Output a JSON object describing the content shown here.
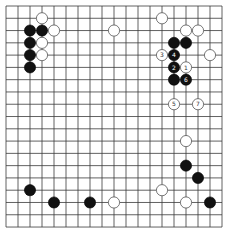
{
  "board": {
    "size": 19,
    "background": "#ffffff",
    "line_color": "#3a3a3a",
    "origin_x": 6,
    "origin_y": 6,
    "spacing_x": 12,
    "spacing_y": 12.28,
    "stone_radius": 5.6
  },
  "stones": [
    {
      "color": "white",
      "col": 3,
      "row": 1,
      "label": ""
    },
    {
      "color": "black",
      "col": 2,
      "row": 2,
      "label": ""
    },
    {
      "color": "black",
      "col": 3,
      "row": 2,
      "label": ""
    },
    {
      "color": "white",
      "col": 4,
      "row": 2,
      "label": ""
    },
    {
      "color": "black",
      "col": 2,
      "row": 3,
      "label": ""
    },
    {
      "color": "white",
      "col": 3,
      "row": 3,
      "label": ""
    },
    {
      "color": "black",
      "col": 2,
      "row": 4,
      "label": ""
    },
    {
      "color": "white",
      "col": 3,
      "row": 4,
      "label": ""
    },
    {
      "color": "black",
      "col": 2,
      "row": 5,
      "label": ""
    },
    {
      "color": "white",
      "col": 9,
      "row": 2,
      "label": ""
    },
    {
      "color": "white",
      "col": 13,
      "row": 1,
      "label": ""
    },
    {
      "color": "white",
      "col": 15,
      "row": 2,
      "label": ""
    },
    {
      "color": "white",
      "col": 16,
      "row": 2,
      "label": ""
    },
    {
      "color": "black",
      "col": 14,
      "row": 3,
      "label": ""
    },
    {
      "color": "black",
      "col": 15,
      "row": 3,
      "label": ""
    },
    {
      "color": "white",
      "col": 13,
      "row": 4,
      "label": "3"
    },
    {
      "color": "black",
      "col": 14,
      "row": 4,
      "label": "4"
    },
    {
      "color": "white",
      "col": 17,
      "row": 4,
      "label": ""
    },
    {
      "color": "black",
      "col": 14,
      "row": 5,
      "label": "2"
    },
    {
      "color": "white",
      "col": 15,
      "row": 5,
      "label": "1"
    },
    {
      "color": "black",
      "col": 14,
      "row": 6,
      "label": ""
    },
    {
      "color": "black",
      "col": 15,
      "row": 6,
      "label": "6"
    },
    {
      "color": "white",
      "col": 14,
      "row": 8,
      "label": "5"
    },
    {
      "color": "white",
      "col": 16,
      "row": 8,
      "label": "7"
    },
    {
      "color": "white",
      "col": 15,
      "row": 11,
      "label": ""
    },
    {
      "color": "black",
      "col": 15,
      "row": 13,
      "label": ""
    },
    {
      "color": "black",
      "col": 16,
      "row": 14,
      "label": ""
    },
    {
      "color": "black",
      "col": 2,
      "row": 15,
      "label": ""
    },
    {
      "color": "white",
      "col": 13,
      "row": 15,
      "label": ""
    },
    {
      "color": "black",
      "col": 4,
      "row": 16,
      "label": ""
    },
    {
      "color": "black",
      "col": 7,
      "row": 16,
      "label": ""
    },
    {
      "color": "white",
      "col": 9,
      "row": 16,
      "label": ""
    },
    {
      "color": "white",
      "col": 15,
      "row": 16,
      "label": ""
    },
    {
      "color": "black",
      "col": 17,
      "row": 16,
      "label": ""
    }
  ]
}
